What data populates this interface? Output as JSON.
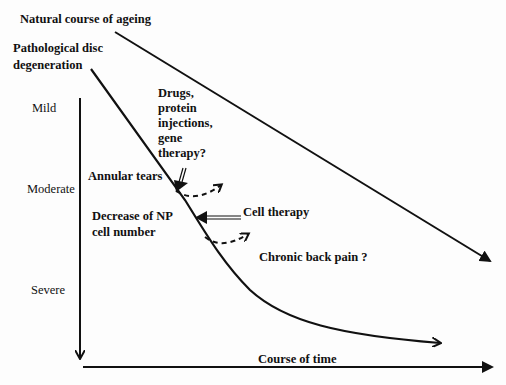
{
  "diagram": {
    "title_lines": {
      "natural_ageing": "Natural course of ageing",
      "pathological_line1": "Pathological disc",
      "pathological_line2": "degeneration"
    },
    "severity_axis": {
      "levels": [
        "Mild",
        "Moderate",
        "Severe"
      ]
    },
    "time_axis": {
      "label": "Course of time"
    },
    "interventions": {
      "drugs_lines": [
        "Drugs,",
        "protein",
        "injections,",
        "gene",
        "therapy?"
      ],
      "cell_therapy": "Cell therapy"
    },
    "events": {
      "annular_tears": "Annular tears",
      "np_decrease_line1": "Decrease of NP",
      "np_decrease_line2": "cell number",
      "chronic_pain": "Chronic back pain ?"
    },
    "colors": {
      "line": "#111111",
      "background": "#fdfdfd"
    }
  }
}
